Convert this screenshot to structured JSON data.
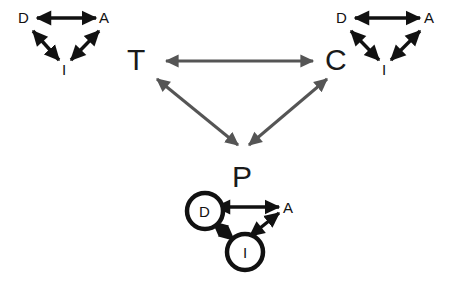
{
  "figure": {
    "background_color": "#ffffff",
    "width": 454,
    "height": 285,
    "dark_color": "#111111",
    "gray_color": "#555555"
  },
  "groups": {
    "top_left": {
      "name": "top-left-triangle",
      "nodes": [
        {
          "id": "D",
          "label": "D",
          "x": 25,
          "y": 18,
          "circled": false
        },
        {
          "id": "A",
          "label": "A",
          "x": 106,
          "y": 18,
          "circled": false
        },
        {
          "id": "I",
          "label": "I",
          "x": 65,
          "y": 69,
          "circled": false
        }
      ],
      "edges": [
        {
          "from": "D",
          "to": "A",
          "style": "double-arrow",
          "color": "#111111"
        },
        {
          "from": "D",
          "to": "I",
          "style": "double-arrow",
          "color": "#111111"
        },
        {
          "from": "I",
          "to": "A",
          "style": "double-arrow",
          "color": "#111111"
        }
      ]
    },
    "top_right": {
      "name": "top-right-triangle",
      "nodes": [
        {
          "id": "D",
          "label": "D",
          "x": 342,
          "y": 18,
          "circled": false
        },
        {
          "id": "A",
          "label": "A",
          "x": 430,
          "y": 18,
          "circled": false
        },
        {
          "id": "I",
          "label": "I",
          "x": 385,
          "y": 69,
          "circled": false
        }
      ],
      "edges": [
        {
          "from": "D",
          "to": "A",
          "style": "double-arrow",
          "color": "#111111"
        },
        {
          "from": "D",
          "to": "I",
          "style": "double-arrow",
          "color": "#111111"
        },
        {
          "from": "I",
          "to": "A",
          "style": "double-arrow",
          "color": "#111111"
        }
      ]
    },
    "bottom": {
      "name": "bottom-triangle",
      "nodes": [
        {
          "id": "D",
          "label": "D",
          "x": 205,
          "y": 211,
          "circled": true,
          "radius": 18
        },
        {
          "id": "A",
          "label": "A",
          "x": 288,
          "y": 207,
          "circled": false
        },
        {
          "id": "I",
          "label": "I",
          "x": 245,
          "y": 252,
          "circled": true,
          "radius": 18
        }
      ],
      "edges": [
        {
          "from": "D",
          "to": "A",
          "style": "double-arrow",
          "color": "#111111"
        },
        {
          "from": "I",
          "to": "D",
          "style": "double-arrow",
          "color": "#111111"
        },
        {
          "from": "I",
          "to": "A",
          "style": "double-arrow",
          "color": "#111111"
        }
      ]
    },
    "center": {
      "name": "center-triangle",
      "nodes": [
        {
          "id": "T",
          "label": "T",
          "x": 138,
          "y": 63
        },
        {
          "id": "C",
          "label": "C",
          "x": 337,
          "y": 63
        },
        {
          "id": "P",
          "label": "P",
          "x": 242,
          "y": 178
        }
      ],
      "edges": [
        {
          "from": "T",
          "to": "C",
          "style": "double-arrow",
          "color": "#555555"
        },
        {
          "from": "T",
          "to": "P",
          "style": "double-arrow",
          "color": "#555555"
        },
        {
          "from": "P",
          "to": "C",
          "style": "double-arrow",
          "color": "#555555"
        }
      ]
    }
  },
  "labels": {
    "T": "T",
    "C": "C",
    "P": "P",
    "tl_D": "D",
    "tl_A": "A",
    "tl_I": "I",
    "tr_D": "D",
    "tr_A": "A",
    "tr_I": "I",
    "b_D": "D",
    "b_A": "A",
    "b_I": "I"
  }
}
